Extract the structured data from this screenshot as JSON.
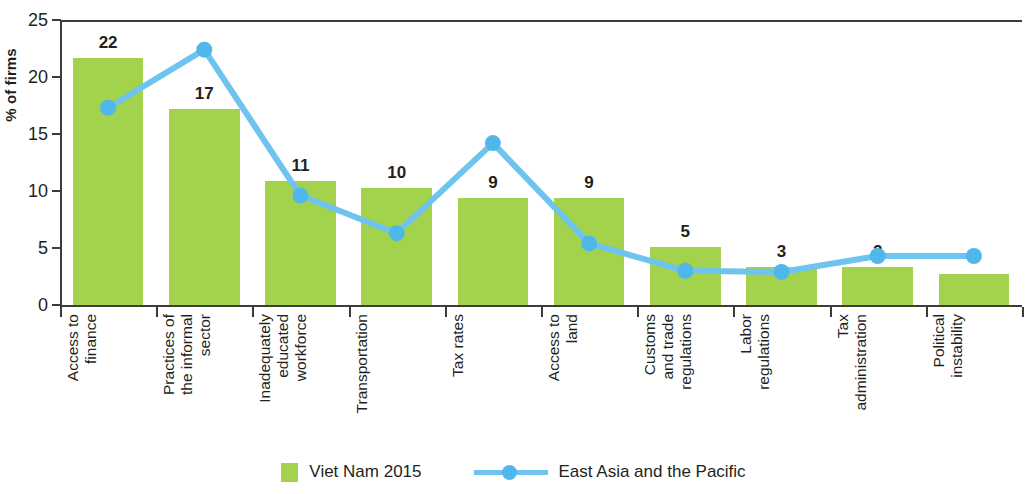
{
  "chart_data": {
    "type": "bar",
    "title": "",
    "subtitle": "",
    "xlabel": "",
    "ylabel": "% of firms",
    "ylim": [
      0,
      25
    ],
    "yticks": [
      0,
      5,
      10,
      15,
      20,
      25
    ],
    "grid": false,
    "legend_position": "bottom",
    "categories": [
      "Access to\nfinance",
      "Practices of\nthe informal\nsector",
      "Inadequately\neducated\nworkforce",
      "Transportation",
      "Tax rates",
      "Access to\nland",
      "Customs\nand trade\nregulations",
      "Labor\nregulations",
      "Tax\nadministration",
      "Political\ninstability"
    ],
    "series": [
      {
        "name": "Viet Nam 2015",
        "type": "bar",
        "color": "#a3d24c",
        "values": [
          21.7,
          17.2,
          10.9,
          10.3,
          9.4,
          9.4,
          5.1,
          3.3,
          3.3,
          2.7
        ],
        "labels": [
          "22",
          "17",
          "11",
          "10",
          "9",
          "9",
          "5",
          "3",
          "2",
          ""
        ]
      },
      {
        "name": "East Asia and the Pacific",
        "type": "line",
        "color": "#6ec4ef",
        "marker_color": "#4fb7ea",
        "values": [
          17.3,
          22.4,
          9.6,
          6.3,
          14.2,
          5.4,
          3.0,
          2.9,
          4.3,
          4.3
        ],
        "labels": [
          "",
          "",
          "",
          "",
          "",
          "",
          "",
          "",
          "",
          ""
        ]
      }
    ]
  },
  "legend": {
    "entries": [
      {
        "label": "Viet Nam 2015",
        "marker": "square-swatch"
      },
      {
        "label": "East Asia and the Pacific",
        "marker": "line-marker-swatch"
      }
    ]
  }
}
